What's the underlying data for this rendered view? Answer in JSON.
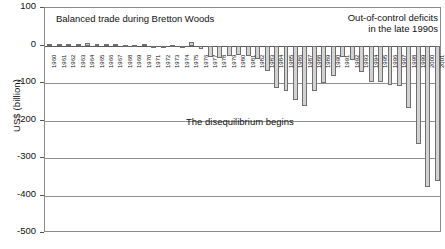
{
  "chart_data": {
    "type": "bar",
    "title": "",
    "xlabel": "",
    "ylabel": "US$ (billion)",
    "ylim": [
      -500,
      100
    ],
    "yticks": [
      100,
      0,
      -100,
      -200,
      -300,
      -400,
      -500
    ],
    "ytick_labels": [
      "100",
      "0",
      "-100",
      "-200",
      "-300",
      "-400",
      "-500"
    ],
    "grid": true,
    "legend": "none",
    "bar_color": "#d2d2d2",
    "bar_edge_color": "#6f6f6f",
    "categories": [
      "1960",
      "1961",
      "1962",
      "1963",
      "1964",
      "1965",
      "1966",
      "1967",
      "1968",
      "1969",
      "1970",
      "1971",
      "1972",
      "1973",
      "1974",
      "1975",
      "1976",
      "1977",
      "1978",
      "1979",
      "1980",
      "1981",
      "1982",
      "1983",
      "1984",
      "1985",
      "1986",
      "1987",
      "1988",
      "1989",
      "1990",
      "1991",
      "1992",
      "1993",
      "1994",
      "1995",
      "1996",
      "1997",
      "1998",
      "1999",
      "2000",
      "2001"
    ],
    "values": [
      4,
      5,
      4,
      5,
      7,
      5,
      4,
      4,
      1,
      1,
      3,
      -2,
      -6,
      1,
      -5,
      9,
      -9,
      -31,
      -34,
      -28,
      -25,
      -28,
      -36,
      -67,
      -112,
      -122,
      -145,
      -160,
      -121,
      -100,
      -81,
      -31,
      -39,
      -70,
      -98,
      -96,
      -104,
      -108,
      -166,
      -263,
      -378,
      -362
    ],
    "annotations": [
      {
        "name": "balanced-trade-note",
        "text": "Balanced trade during Bretton Woods"
      },
      {
        "name": "out-of-control-note",
        "text": "Out-of-control deficits\nin the late 1990s"
      },
      {
        "name": "disequilibrium-note",
        "text": "The disequilibrium begins"
      }
    ]
  }
}
